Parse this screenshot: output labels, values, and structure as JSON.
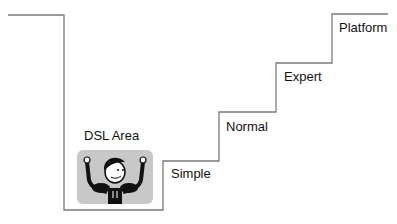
{
  "diagram": {
    "type": "staircase",
    "steps": [
      {
        "label": "DSL Area",
        "level": 0
      },
      {
        "label": "Simple",
        "level": 1
      },
      {
        "label": "Normal",
        "level": 2
      },
      {
        "label": "Expert",
        "level": 3
      },
      {
        "label": "Platform",
        "level": 4
      }
    ],
    "illustration": "strong-man-icon",
    "line_color": "#7a7a7a"
  }
}
